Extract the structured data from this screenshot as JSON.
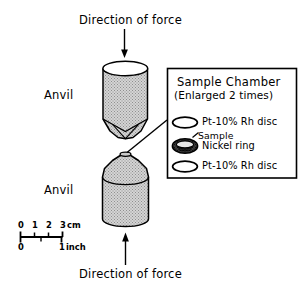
{
  "figure": {
    "width": 301,
    "height": 288,
    "background": "#ffffff",
    "stroke_color": "#000000",
    "anvil_fill": "#d0d0d0",
    "anvil_hatch": "#9a9a9a",
    "nickel_ring_fill": "#3a3a3a",
    "disc_fill": "#ffffff"
  },
  "labels": {
    "force_top": "Direction of force",
    "force_bottom": "Direction of force",
    "anvil_upper": "Anvil",
    "anvil_lower": "Anvil"
  },
  "chamber": {
    "title": "Sample Chamber",
    "subtitle": "(Enlarged  2 times)",
    "items": [
      {
        "label": "Pt-10% Rh disc",
        "icon": "open-ellipse-disc-icon"
      },
      {
        "label": "Sample",
        "icon": "leader-line-icon"
      },
      {
        "label": "Nickel ring",
        "icon": "shaded-ring-icon"
      },
      {
        "label": "Pt-10% Rh disc",
        "icon": "open-ellipse-disc-icon"
      }
    ]
  },
  "scale_bar": {
    "cm_ticks": [
      "0",
      "1",
      "2",
      "3"
    ],
    "cm_unit": "cm",
    "inch_ticks": [
      "0",
      "1"
    ],
    "inch_unit": "inch"
  }
}
